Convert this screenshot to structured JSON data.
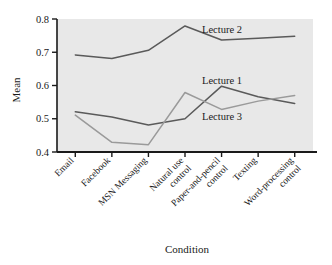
{
  "chart_data": {
    "type": "line",
    "title": "",
    "xlabel": "Condition",
    "ylabel": "Mean",
    "ylim": [
      0.4,
      0.8
    ],
    "yticks": [
      "0.4",
      "0.5",
      "0.6",
      "0.7",
      "0.8"
    ],
    "grid": false,
    "legend_position": "inline-right",
    "plot_background": "#e8e8e8",
    "categories": [
      "Email",
      "Facebook",
      "MSN Messaging",
      "Natural use\ncontrol",
      "Paper-and-pencil\ncontrol",
      "Texting",
      "Word-processing\ncontrol"
    ],
    "category_lines": [
      [
        "Email"
      ],
      [
        "Facebook"
      ],
      [
        "MSN Messaging"
      ],
      [
        "Natural use",
        "control"
      ],
      [
        "Paper-and-pencil",
        "control"
      ],
      [
        "Texting"
      ],
      [
        "Word-processing",
        "control"
      ]
    ],
    "series": [
      {
        "name": "Lecture 2",
        "color": "#5a5a5a",
        "values": [
          0.692,
          0.681,
          0.706,
          0.779,
          0.737,
          0.742,
          0.748
        ]
      },
      {
        "name": "Lecture 1",
        "color": "#5a5a5a",
        "values": [
          0.521,
          0.505,
          0.481,
          0.5,
          0.598,
          0.566,
          0.546
        ]
      },
      {
        "name": "Lecture 3",
        "color": "#9a9a9a",
        "values": [
          0.511,
          0.429,
          0.422,
          0.579,
          0.528,
          0.553,
          0.57
        ]
      }
    ],
    "annotations": [
      {
        "text": "Lecture 2",
        "x_px": 222,
        "y_px": 33
      },
      {
        "text": "Lecture 1",
        "x_px": 222,
        "y_px": 84
      },
      {
        "text": "Lecture 3",
        "x_px": 222,
        "y_px": 120
      }
    ]
  }
}
